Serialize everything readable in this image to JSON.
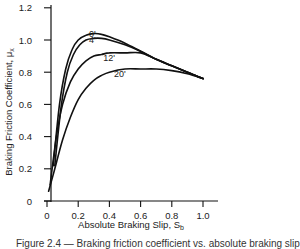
{
  "chart_data": {
    "type": "line",
    "title": "",
    "xlabel": "Absolute Braking Slip, S_b",
    "ylabel": "Braking Friction Coefficient, μ_x",
    "xlim": [
      0,
      1.05
    ],
    "ylim": [
      0,
      1.25
    ],
    "x_ticks": [
      "0",
      "0.2",
      "0.4",
      "0.6",
      "0.8",
      "1.0"
    ],
    "y_ticks": [
      "0",
      "0.2",
      "0.4",
      "0.6",
      "0.8",
      "1.0",
      "1.2"
    ],
    "grid": false,
    "legend": "inline curve labels",
    "series": [
      {
        "name": "0'",
        "x": [
          0.04,
          0.08,
          0.12,
          0.16,
          0.2,
          0.25,
          0.3,
          0.35,
          0.4,
          0.5,
          0.6,
          0.7,
          0.8,
          0.9,
          1.0
        ],
        "y": [
          0.22,
          0.6,
          0.82,
          0.94,
          1.0,
          1.03,
          1.04,
          1.035,
          1.02,
          0.98,
          0.93,
          0.88,
          0.84,
          0.8,
          0.76
        ]
      },
      {
        "name": "4'",
        "x": [
          0.05,
          0.09,
          0.13,
          0.17,
          0.21,
          0.25,
          0.3,
          0.35,
          0.4,
          0.5,
          0.6,
          0.7,
          0.8,
          0.9,
          1.0
        ],
        "y": [
          0.22,
          0.58,
          0.8,
          0.91,
          0.97,
          1.0,
          1.01,
          1.01,
          1.0,
          0.97,
          0.93,
          0.88,
          0.84,
          0.8,
          0.76
        ]
      },
      {
        "name": "12'",
        "x": [
          0.02,
          0.06,
          0.1,
          0.15,
          0.2,
          0.25,
          0.3,
          0.35,
          0.4,
          0.5,
          0.6,
          0.7,
          0.8,
          0.9,
          1.0
        ],
        "y": [
          0.1,
          0.4,
          0.6,
          0.74,
          0.82,
          0.87,
          0.9,
          0.91,
          0.92,
          0.92,
          0.92,
          0.88,
          0.84,
          0.8,
          0.76
        ]
      },
      {
        "name": "20'",
        "x": [
          0.01,
          0.05,
          0.1,
          0.15,
          0.2,
          0.25,
          0.3,
          0.35,
          0.4,
          0.5,
          0.6,
          0.7,
          0.8,
          0.9,
          1.0
        ],
        "y": [
          0.06,
          0.2,
          0.38,
          0.52,
          0.63,
          0.7,
          0.75,
          0.78,
          0.8,
          0.82,
          0.82,
          0.82,
          0.81,
          0.79,
          0.76
        ]
      }
    ],
    "labels": [
      {
        "text": "0'",
        "x": 0.27,
        "y": 1.04
      },
      {
        "text": "4'",
        "x": 0.27,
        "y": 1.0
      },
      {
        "text": "12'",
        "x": 0.36,
        "y": 0.89
      },
      {
        "text": "20'",
        "x": 0.43,
        "y": 0.79
      }
    ]
  },
  "caption": "Figure 2.4 — Braking friction coefficient vs. absolute braking slip"
}
